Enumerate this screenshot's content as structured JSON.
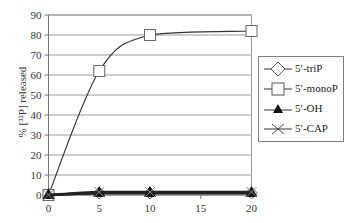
{
  "chart_data": {
    "type": "line",
    "title": "",
    "xlabel": "",
    "ylabel": "% [32P] released",
    "ylabel_display": "% [³²P] released",
    "x": [
      0,
      5,
      10,
      20
    ],
    "xticks": [
      0,
      5,
      10,
      15,
      20
    ],
    "yticks": [
      0,
      10,
      20,
      30,
      40,
      50,
      60,
      70,
      80,
      90
    ],
    "xlim": [
      0,
      20
    ],
    "ylim": [
      0,
      90
    ],
    "grid": "horizontal",
    "legend_position": "right",
    "series": [
      {
        "name": "5'-triP",
        "label": "5′-triP",
        "marker": "diamond-open",
        "values": [
          0,
          1,
          1,
          1
        ]
      },
      {
        "name": "5'-monoP",
        "label": "5′-monoP",
        "marker": "square-open",
        "values": [
          0,
          62,
          80,
          82
        ]
      },
      {
        "name": "5'-OH",
        "label": "5′-OH",
        "marker": "triangle-filled",
        "values": [
          0,
          1,
          1,
          1
        ]
      },
      {
        "name": "5'-CAP",
        "label": "5′-CAP",
        "marker": "x",
        "values": [
          0,
          1.5,
          1.5,
          1.5
        ]
      }
    ]
  }
}
